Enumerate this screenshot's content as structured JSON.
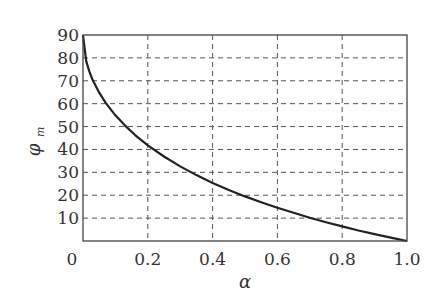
{
  "chart_data": {
    "type": "line",
    "title": "",
    "xlabel": "α",
    "ylabel": "φ_m",
    "ylabel_main": "φ",
    "ylabel_sub": "m",
    "xlim": [
      0,
      1.0
    ],
    "ylim": [
      0,
      90
    ],
    "x_ticks": [
      "0",
      "0.2",
      "0.4",
      "0.6",
      "0.8",
      "1.0"
    ],
    "x_tick_values": [
      0,
      0.2,
      0.4,
      0.6,
      0.8,
      1.0
    ],
    "y_ticks": [
      "10",
      "20",
      "30",
      "40",
      "50",
      "60",
      "70",
      "80",
      "90"
    ],
    "y_tick_values": [
      10,
      20,
      30,
      40,
      50,
      60,
      70,
      80,
      90
    ],
    "grid": true,
    "grid_style": "dashed",
    "legend": null,
    "series": [
      {
        "name": "φ_m(α)",
        "color": "#222222",
        "x": [
          0.0,
          0.01,
          0.02,
          0.03,
          0.05,
          0.07,
          0.1,
          0.13,
          0.16,
          0.2,
          0.25,
          0.3,
          0.35,
          0.4,
          0.45,
          0.5,
          0.55,
          0.6,
          0.65,
          0.7,
          0.75,
          0.8,
          0.85,
          0.9,
          0.95,
          1.0
        ],
        "y": [
          90.0,
          78.6,
          73.9,
          70.3,
          64.8,
          60.4,
          54.9,
          50.4,
          46.4,
          41.8,
          36.9,
          32.6,
          28.8,
          25.4,
          22.3,
          19.5,
          16.9,
          14.5,
          12.3,
          10.2,
          8.2,
          6.4,
          4.6,
          3.0,
          1.5,
          0.0
        ]
      }
    ]
  }
}
